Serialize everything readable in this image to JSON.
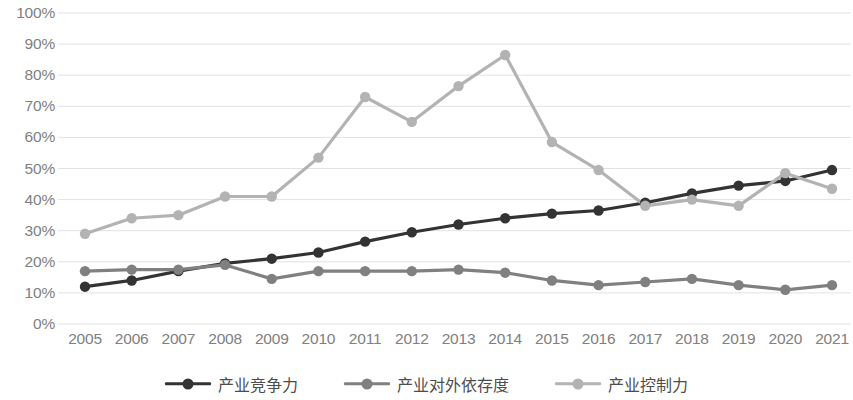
{
  "chart_data": {
    "type": "line",
    "title": "",
    "xlabel": "",
    "ylabel": "",
    "ylim": [
      0,
      100
    ],
    "y_tick_labels": [
      "100%",
      "90%",
      "80%",
      "70%",
      "60%",
      "50%",
      "40%",
      "30%",
      "20%",
      "10%",
      "0%"
    ],
    "y_ticks": [
      100,
      90,
      80,
      70,
      60,
      50,
      40,
      30,
      20,
      10,
      0
    ],
    "grid": true,
    "legend_position": "bottom",
    "categories": [
      "2005",
      "2006",
      "2007",
      "2008",
      "2009",
      "2010",
      "2011",
      "2012",
      "2013",
      "2014",
      "2015",
      "2016",
      "2017",
      "2018",
      "2019",
      "2020",
      "2021"
    ],
    "series": [
      {
        "name": "产业竞争力",
        "color": "#333333",
        "values": [
          12,
          14,
          17,
          19.5,
          21,
          23,
          26.5,
          29.5,
          32,
          34,
          35.5,
          36.5,
          39,
          42,
          44.5,
          46,
          49.5
        ]
      },
      {
        "name": "产业对外依存度",
        "color": "#808080",
        "values": [
          17,
          17.5,
          17.5,
          19,
          14.5,
          17,
          17,
          17,
          17.5,
          16.5,
          14,
          12.5,
          13.5,
          14.5,
          12.5,
          11,
          12.5
        ]
      },
      {
        "name": "产业控制力",
        "color": "#b3b3b3",
        "values": [
          29,
          34,
          35,
          41,
          41,
          53.5,
          73,
          65,
          76.5,
          86.5,
          58.5,
          49.5,
          38,
          40,
          38,
          48.5,
          43.5
        ]
      }
    ]
  },
  "legend": {
    "items": [
      {
        "label": "产业竞争力"
      },
      {
        "label": "产业对外依存度"
      },
      {
        "label": "产业控制力"
      }
    ]
  },
  "colors": {
    "series_1": "#333333",
    "series_2": "#808080",
    "series_3": "#b3b3b3",
    "gridline": "#e2e2e2",
    "tick_text": "#808080",
    "legend_text": "#4d4d4d",
    "background": "#ffffff"
  }
}
